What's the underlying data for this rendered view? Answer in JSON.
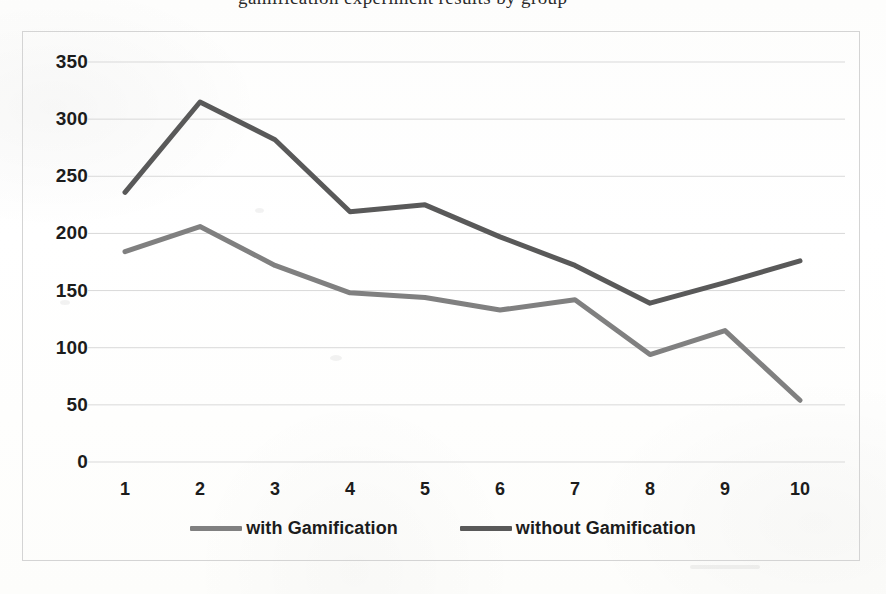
{
  "page": {
    "partial_top_text": "gamification experiment results by group"
  },
  "chart": {
    "frame_border_color": "#d4d4d4",
    "gridline_color": "#d9d9d9",
    "background": "#ffffff"
  },
  "legend": {
    "position": "bottom-center",
    "entries": [
      {
        "label": "with Gamification",
        "color": "#808080"
      },
      {
        "label": "without Gamification",
        "color": "#595959"
      }
    ]
  },
  "chart_data": {
    "type": "line",
    "title": "",
    "xlabel": "",
    "ylabel": "",
    "categories": [
      "1",
      "2",
      "3",
      "4",
      "5",
      "6",
      "7",
      "8",
      "9",
      "10"
    ],
    "ylim": [
      0,
      350
    ],
    "ytick_labels": [
      "0",
      "50",
      "100",
      "150",
      "200",
      "250",
      "300",
      "350"
    ],
    "ytick_values": [
      0,
      50,
      100,
      150,
      200,
      250,
      300,
      350
    ],
    "grid": true,
    "legend_position": "bottom",
    "series": [
      {
        "name": "with Gamification",
        "color": "#808080",
        "values": [
          184,
          206,
          172,
          148,
          144,
          133,
          142,
          94,
          115,
          54
        ]
      },
      {
        "name": "without Gamification",
        "color": "#595959",
        "values": [
          236,
          315,
          282,
          219,
          225,
          197,
          172,
          139,
          157,
          176
        ]
      }
    ]
  }
}
